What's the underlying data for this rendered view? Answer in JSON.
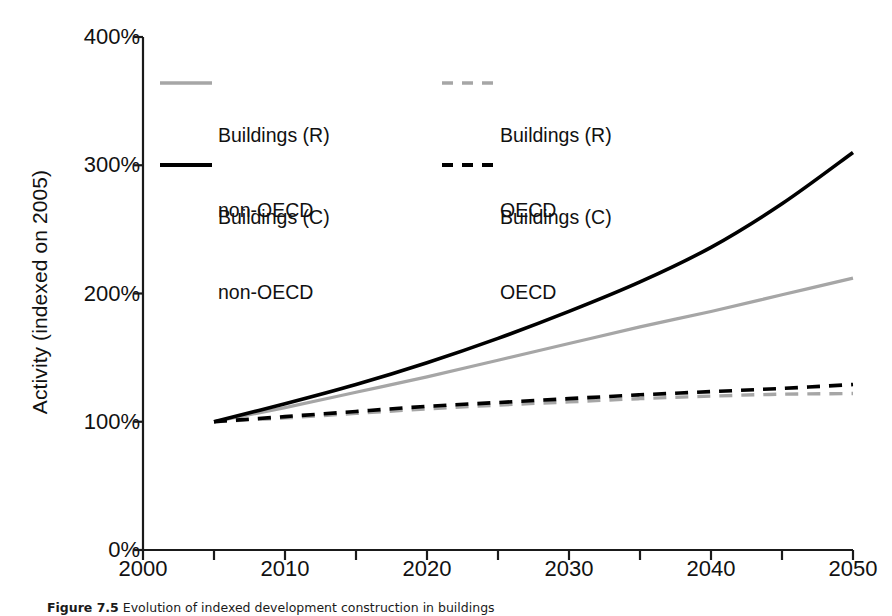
{
  "figure": {
    "caption_label": "Figure 7.5",
    "caption_text": "Evolution of indexed development construction in buildings"
  },
  "chart_data": {
    "type": "line",
    "title": "",
    "xlabel": "",
    "ylabel": "Activity (indexed on 2005)",
    "xlim": [
      2000,
      2050
    ],
    "ylim": [
      0,
      400
    ],
    "grid": false,
    "legend_position": "top-left-inside",
    "xticks": [
      2000,
      2010,
      2020,
      2030,
      2040,
      2050
    ],
    "xtick_labels": [
      "2000",
      "2010",
      "2020",
      "2030",
      "2040",
      "2050"
    ],
    "xminor_ticks": [
      2005,
      2015,
      2025,
      2035,
      2045
    ],
    "yticks": [
      0,
      100,
      200,
      300,
      400
    ],
    "ytick_labels": [
      "0%",
      "100%",
      "200%",
      "300%",
      "400%"
    ],
    "x": [
      2005,
      2010,
      2015,
      2020,
      2025,
      2030,
      2035,
      2040,
      2045,
      2050
    ],
    "series": [
      {
        "name": "Buildings (R) non-OECD",
        "style": "solid",
        "color": "#A6A6A6",
        "width": 3.2,
        "values": [
          100,
          111,
          123,
          135,
          148,
          161,
          174,
          186,
          199,
          212
        ]
      },
      {
        "name": "Buildings (R) OECD",
        "style": "dashed",
        "color": "#A6A6A6",
        "width": 3.4,
        "values": [
          100,
          103,
          106.5,
          110,
          113,
          115.5,
          118,
          120,
          121.5,
          122
        ]
      },
      {
        "name": "Buildings (C) non-OECD",
        "style": "solid",
        "color": "#000000",
        "width": 3.6,
        "values": [
          100,
          114,
          129,
          146,
          165,
          186,
          209,
          236,
          270,
          310
        ]
      },
      {
        "name": "Buildings (C) OECD",
        "style": "dashed",
        "color": "#000000",
        "width": 3.6,
        "values": [
          100,
          104,
          108,
          112,
          115,
          118,
          121,
          123.5,
          126,
          129
        ]
      }
    ]
  },
  "legend": {
    "entries": [
      {
        "label_line1": "Buildings (R)",
        "label_line2": "non-OECD",
        "style": "solid",
        "color": "#A6A6A6"
      },
      {
        "label_line1": "Buildings (R)",
        "label_line2": "OECD",
        "style": "dashed",
        "color": "#A6A6A6"
      },
      {
        "label_line1": "Buildings (C)",
        "label_line2": "non-OECD",
        "style": "solid",
        "color": "#000000"
      },
      {
        "label_line1": "Buildings (C)",
        "label_line2": "OECD",
        "style": "dashed",
        "color": "#000000"
      }
    ]
  }
}
